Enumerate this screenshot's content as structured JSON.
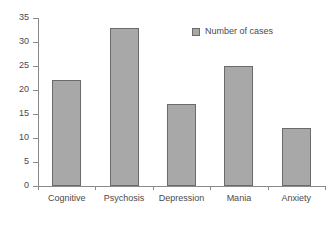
{
  "chart_data": {
    "type": "bar",
    "title": "",
    "xlabel": "",
    "ylabel": "",
    "categories": [
      "Cognitive",
      "Psychosis",
      "Depression",
      "Mania",
      "Anxiety"
    ],
    "values": [
      22,
      33,
      17,
      25,
      12
    ],
    "series": [
      {
        "name": "Number of cases",
        "values": [
          22,
          33,
          17,
          25,
          12
        ]
      }
    ],
    "ylim": [
      0,
      35
    ],
    "y_ticks": [
      0,
      5,
      10,
      15,
      20,
      25,
      30,
      35
    ],
    "y_tick_labels": [
      "0",
      "5",
      "10",
      "15",
      "20",
      "25",
      "30",
      "35"
    ],
    "grid": false,
    "legend_position": "upper-right-inside",
    "bar_color": "#a8a8a8",
    "bar_border_color": "#6b6b6b",
    "axis_color": "#8a8a8a",
    "text_color": "#4a4a4a",
    "background": "#ffffff"
  },
  "legend": {
    "entries": [
      {
        "label": "Number of cases",
        "color": "#a8a8a8"
      }
    ]
  }
}
